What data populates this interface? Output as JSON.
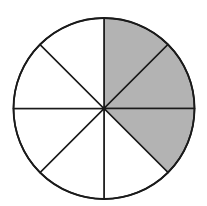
{
  "diagram": {
    "type": "fraction-circle",
    "total_sectors": 8,
    "shaded_sectors": [
      0,
      1,
      2
    ],
    "shaded_fraction": "3/8",
    "center": [
      104,
      108.5
    ],
    "radius": 90.5,
    "colors": {
      "background": "#ffffff",
      "shaded": "#b3b3b3",
      "unshaded": "#ffffff",
      "stroke": "#1a1a1a"
    }
  }
}
